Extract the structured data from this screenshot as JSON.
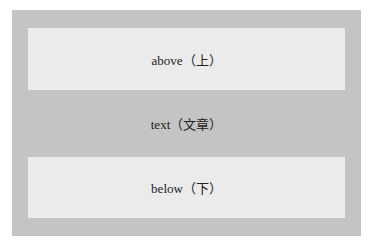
{
  "colors": {
    "outer": "#c4c4c4",
    "inner": "#ebebeb"
  },
  "bands": [
    {
      "label": "above（上）"
    },
    {
      "label": "text（文章）"
    },
    {
      "label": "below（下）"
    }
  ]
}
